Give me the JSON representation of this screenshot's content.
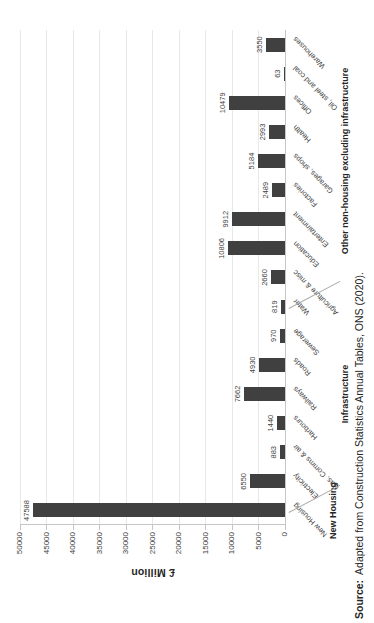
{
  "chart_data": {
    "type": "bar",
    "title": "",
    "xlabel": "",
    "ylabel": "£ Million",
    "ylim": [
      0,
      50000
    ],
    "yticks": [
      0,
      5000,
      10000,
      15000,
      20000,
      25000,
      30000,
      35000,
      40000,
      45000,
      50000
    ],
    "grid": true,
    "legend": false,
    "bar_color": "#404040",
    "layout": {
      "rotated_90_ccw_on_page": true,
      "data_labels": "outside end"
    },
    "categories": [
      "New Housing",
      "Electricity",
      "Gas, Comms & air",
      "Harbours",
      "Railways",
      "Roads",
      "Sewerage",
      "Water",
      "Agriculture & misc",
      "Education",
      "Entertainment",
      "Factories",
      "Garages, shops",
      "Health",
      "Offices",
      "Oil, steel and coal",
      "Warehouses"
    ],
    "values": [
      47588,
      6550,
      883,
      1440,
      7662,
      4930,
      970,
      819,
      2660,
      10806,
      9912,
      2489,
      5184,
      2993,
      10479,
      63,
      3550
    ],
    "groups": [
      {
        "label": "New Housing",
        "start": 0,
        "end": 0
      },
      {
        "label": "Infrastructure",
        "start": 1,
        "end": 7
      },
      {
        "label": "Other non-housing excluding infrastructure",
        "start": 8,
        "end": 16
      }
    ]
  },
  "source": {
    "label": "Source:",
    "text": "Adapted from Construction Statistics Annual Tables, ONS (2020)."
  }
}
